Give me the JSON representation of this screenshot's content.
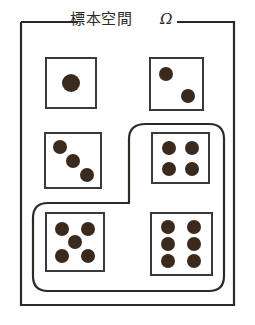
{
  "diagram": {
    "title": "標本空間",
    "title_symbol": "Ω",
    "title_full": "標本空間 Ω",
    "type": "venn-set-diagram",
    "description_label": "sample-space-frame",
    "colors": {
      "frame_stroke": "#2b2a27",
      "subset_stroke": "#2b2a27",
      "die_stroke": "#3b3a36",
      "pip_fill": "#3a2a1e",
      "background": "#ffffff"
    },
    "frame": {
      "label": "outer-rectangle",
      "x": 21,
      "y": 22,
      "width": 213,
      "height": 283,
      "stroke_width": 2
    },
    "subset": {
      "label": "event-subset",
      "shape": "rounded-L",
      "stroke_width": 2,
      "contains": [
        "die-4",
        "die-5",
        "die-6"
      ]
    },
    "dice": [
      {
        "id": "die-1",
        "name": "die-face-1",
        "value": 1,
        "x": 46,
        "y": 58,
        "size": 50,
        "in_subset": false,
        "pips": [
          [
            0.5,
            0.5
          ]
        ]
      },
      {
        "id": "die-2",
        "name": "die-face-2",
        "value": 2,
        "x": 150,
        "y": 58,
        "size": 53,
        "in_subset": false,
        "pips": [
          [
            0.3,
            0.3
          ],
          [
            0.72,
            0.72
          ]
        ]
      },
      {
        "id": "die-3",
        "name": "die-face-3",
        "value": 3,
        "x": 45,
        "y": 133,
        "size": 56,
        "in_subset": false,
        "pips": [
          [
            0.26,
            0.25
          ],
          [
            0.5,
            0.5
          ],
          [
            0.76,
            0.76
          ]
        ]
      },
      {
        "id": "die-4",
        "name": "die-face-4",
        "value": 4,
        "x": 152,
        "y": 133,
        "size": 56,
        "in_subset": true,
        "pips": [
          [
            0.3,
            0.3
          ],
          [
            0.7,
            0.3
          ],
          [
            0.3,
            0.7
          ],
          [
            0.7,
            0.7
          ]
        ]
      },
      {
        "id": "die-5",
        "name": "die-face-5",
        "value": 5,
        "x": 46,
        "y": 213,
        "size": 58,
        "in_subset": true,
        "pips": [
          [
            0.28,
            0.28
          ],
          [
            0.72,
            0.28
          ],
          [
            0.5,
            0.5
          ],
          [
            0.28,
            0.72
          ],
          [
            0.72,
            0.72
          ]
        ]
      },
      {
        "id": "die-6",
        "name": "die-face-6",
        "value": 6,
        "x": 151,
        "y": 213,
        "size_w": 60,
        "size_h": 61,
        "in_subset": true,
        "pips": [
          [
            0.3,
            0.22
          ],
          [
            0.7,
            0.22
          ],
          [
            0.3,
            0.5
          ],
          [
            0.7,
            0.5
          ],
          [
            0.3,
            0.78
          ],
          [
            0.7,
            0.78
          ]
        ]
      }
    ]
  }
}
